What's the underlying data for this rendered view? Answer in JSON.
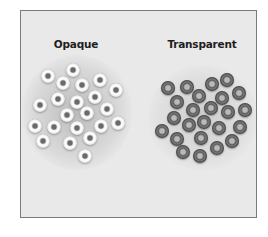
{
  "figure": {
    "labels": [
      {
        "id": "opaque",
        "text": "Opaque",
        "x": 76
      },
      {
        "id": "transparent",
        "text": "Transparent",
        "x": 202
      }
    ],
    "colors": {
      "background": "#e9e9e9",
      "border": "#7a7a7a",
      "label": "#1e1e1e",
      "opaque_bead": "#ffffff",
      "transparent_bead": "#5c5c5c"
    },
    "clusters": {
      "opaque": {
        "count": 22,
        "beads": [
          [
            73,
            70
          ],
          [
            48,
            76
          ],
          [
            63,
            83
          ],
          [
            82,
            85
          ],
          [
            100,
            80
          ],
          [
            116,
            90
          ],
          [
            58,
            99
          ],
          [
            77,
            102
          ],
          [
            95,
            97
          ],
          [
            40,
            105
          ],
          [
            107,
            109
          ],
          [
            67,
            115
          ],
          [
            87,
            113
          ],
          [
            35,
            126
          ],
          [
            54,
            127
          ],
          [
            77,
            128
          ],
          [
            101,
            126
          ],
          [
            118,
            123
          ],
          [
            43,
            141
          ],
          [
            70,
            143
          ],
          [
            90,
            138
          ],
          [
            85,
            156
          ]
        ]
      },
      "transparent": {
        "count": 24,
        "beads": [
          [
            168,
            88
          ],
          [
            187,
            87
          ],
          [
            212,
            84
          ],
          [
            227,
            80
          ],
          [
            239,
            93
          ],
          [
            177,
            102
          ],
          [
            199,
            96
          ],
          [
            222,
            98
          ],
          [
            245,
            110
          ],
          [
            193,
            110
          ],
          [
            211,
            108
          ],
          [
            228,
            112
          ],
          [
            174,
            118
          ],
          [
            189,
            125
          ],
          [
            204,
            122
          ],
          [
            219,
            128
          ],
          [
            240,
            127
          ],
          [
            162,
            131
          ],
          [
            177,
            139
          ],
          [
            201,
            138
          ],
          [
            232,
            141
          ],
          [
            183,
            152
          ],
          [
            200,
            156
          ],
          [
            217,
            148
          ]
        ]
      }
    }
  }
}
